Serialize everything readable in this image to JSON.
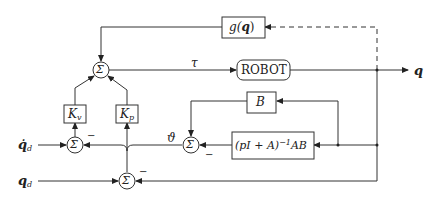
{
  "diagram": {
    "type": "block-diagram",
    "title": "",
    "blocks": {
      "gravity": {
        "func": "g(",
        "arg": "q",
        "close": ")"
      },
      "robot": {
        "label": "ROBOT"
      },
      "kv": {
        "main": "K",
        "sub": "v"
      },
      "kp": {
        "main": "K",
        "sub": "p"
      },
      "b": {
        "label": "B"
      },
      "filter": {
        "prefix": "(pI + A)",
        "exp": "−1",
        "suffix": "AB"
      }
    },
    "summing_junctions": {
      "top": {
        "symbol": "Σ"
      },
      "velocity": {
        "symbol": "Σ"
      },
      "theta": {
        "symbol": "Σ"
      },
      "position": {
        "symbol": "Σ"
      }
    },
    "signals": {
      "tau": "τ",
      "q_out": "q",
      "qdot_d_main": "q̇",
      "qdot_d_sub": "d",
      "q_d_main": "q",
      "q_d_sub": "d",
      "theta": "ϑ"
    },
    "signs": {
      "velocity_minus": "−",
      "theta_minus": "−",
      "position_minus": "−"
    },
    "colors": {
      "line": "#333333",
      "background": "#ffffff"
    }
  }
}
